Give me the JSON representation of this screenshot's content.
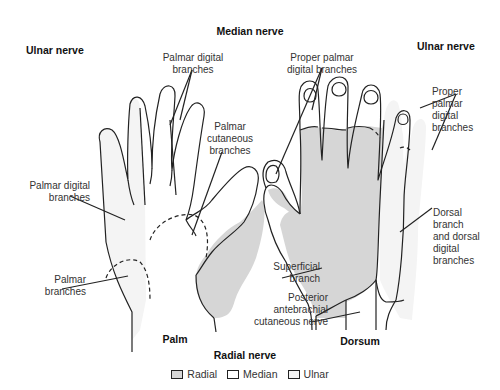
{
  "diagram": {
    "headings": {
      "top_center": "Median nerve",
      "top_left": "Ulnar nerve",
      "top_right": "Ulnar nerve",
      "bottom_center": "Radial nerve",
      "palm": "Palm",
      "dorsum": "Dorsum"
    },
    "palm_labels": {
      "palmar_digital_top": "Palmar digital\nbranches",
      "palmar_cutaneous": "Palmar\ncutaneous\nbranches",
      "palmar_digital_left": "Palmar digital\nbranches",
      "palmar_branches": "Palmar\nbranches"
    },
    "dorsum_labels": {
      "proper_palmar_top": "Proper palmar\ndigital branches",
      "proper_palmar_right": "Proper\npalmar\ndigital\nbranches",
      "dorsal_branch": "Dorsal\nbranch\nand dorsal\ndigital\nbranches",
      "superficial_branch": "Superficial\nbranch",
      "posterior_antebrachial": "Posterior\nantebrachial\ncutaneous nerve"
    },
    "legend": [
      {
        "label": "Radial",
        "color": "#d6d6d6"
      },
      {
        "label": "Median",
        "color": "#ffffff"
      },
      {
        "label": "Ulnar",
        "color": "#f4f4f4"
      }
    ],
    "colors": {
      "radial": "#d6d6d6",
      "median": "#ffffff",
      "ulnar": "#f4f4f4",
      "outline": "#222222"
    }
  }
}
